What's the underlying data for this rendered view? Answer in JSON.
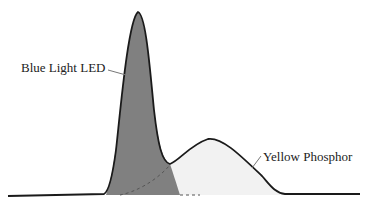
{
  "diagram": {
    "labels": {
      "blue": "Blue Light LED",
      "yellow": "Yellow Phosphor"
    },
    "colors": {
      "blue_fill": "#808080",
      "yellow_fill": "#f2f2f2",
      "outline": "#1a1a1a",
      "dashed": "#555555",
      "leader": "#777777"
    },
    "components": [
      {
        "name": "Blue Light LED",
        "peak_x": 138,
        "peak_y": 12,
        "shape": "narrow peak"
      },
      {
        "name": "Yellow Phosphor",
        "peak_x": 208,
        "peak_y": 139,
        "shape": "broad hump"
      }
    ]
  }
}
